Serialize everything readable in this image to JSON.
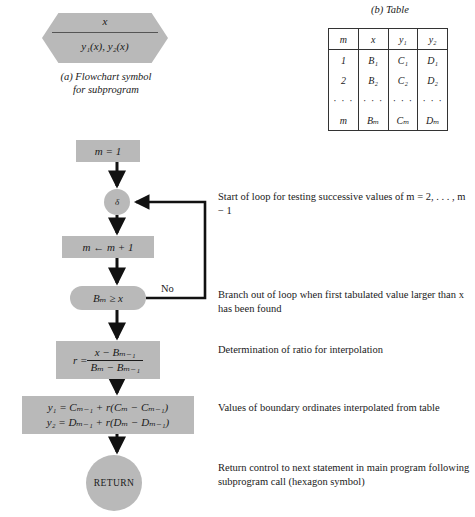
{
  "figure": {
    "panel_a": {
      "caption_line1": "(a) Flowchart symbol",
      "caption_line2": "for subprogram",
      "hexagon_top": "x",
      "hexagon_bottom": "y₁(x), y₂(x)"
    },
    "panel_b": {
      "caption": "(b) Table",
      "headers": [
        "m",
        "x",
        "y₁",
        "y₂"
      ],
      "rows": [
        [
          "1",
          "B₁",
          "C₁",
          "D₁"
        ],
        [
          "2",
          "B₂",
          "C₂",
          "D₂"
        ],
        [
          "· · ·",
          "· · ·",
          "· · ·",
          "· · ·"
        ],
        [
          "m",
          "Bₘ",
          "Cₘ",
          "Dₘ"
        ]
      ]
    }
  },
  "flowchart": {
    "init_box": "m = 1",
    "connector_label": "δ",
    "increment_box": "m ← m + 1",
    "decision_box": "Bₘ ≥ x",
    "branch_label": "No",
    "ratio_box_numerator": "x − Bₘ₋₁",
    "ratio_box_denominator": "Bₘ − Bₘ₋₁",
    "ratio_box_lhs": "r =",
    "interp_line1": "y₁ = Cₘ₋₁ + r(Cₘ − Cₘ₋₁)",
    "interp_line2": "y₂ = Dₘ₋₁ + r(Dₘ − Dₘ₋₁)",
    "return_terminal": "RETURN"
  },
  "annotations": {
    "loop_start": "Start of loop for testing successive values of m = 2, . . . , m − 1",
    "branch_out": "Branch out of loop when first tabulated value larger than x has been found",
    "ratio": "Determination of ratio for interpolation",
    "values": "Values of boundary ordinates interpolated from table",
    "return": "Return control to next statement in main program following subprogram call (hexagon symbol)"
  },
  "colors": {
    "shape_fill": "#b9b9b9",
    "line": "#111111",
    "background": "#ffffff",
    "text": "#1a1a1a"
  }
}
